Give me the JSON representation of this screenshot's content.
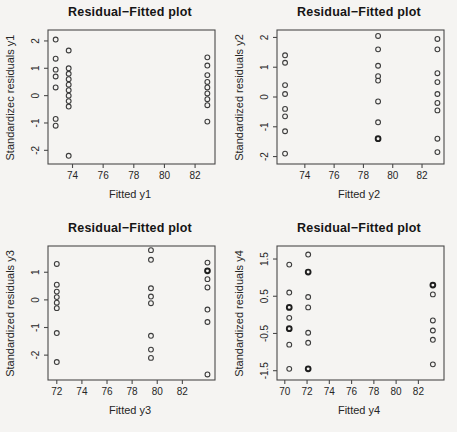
{
  "page": {
    "background": "#f5f4f2",
    "axis_color": "#4a4a4a",
    "text_color": "#262626",
    "point_color": "#3c3c3c",
    "bold_point_color": "#1e1e1e"
  },
  "chart_data": [
    {
      "type": "scatter",
      "title": "Residual−Fitted plot",
      "xlabel": "Fitted y1",
      "ylabel": "Standardizec residuals y1",
      "xlim": [
        72.4,
        83.3
      ],
      "ylim": [
        -2.5,
        2.4
      ],
      "xticks": [
        74,
        76,
        78,
        80,
        82
      ],
      "yticks": [
        -2,
        -1,
        0,
        1,
        2
      ],
      "grid": false,
      "legend": false,
      "points": [
        [
          72.9,
          2.05
        ],
        [
          72.9,
          1.35
        ],
        [
          72.9,
          0.95
        ],
        [
          72.9,
          0.7
        ],
        [
          72.9,
          0.3
        ],
        [
          72.9,
          -0.85
        ],
        [
          72.9,
          -1.1
        ],
        [
          73.75,
          1.65
        ],
        [
          73.75,
          1.0
        ],
        [
          73.75,
          0.8
        ],
        [
          73.75,
          0.6
        ],
        [
          73.75,
          0.4
        ],
        [
          73.75,
          0.2
        ],
        [
          73.75,
          0.0
        ],
        [
          73.75,
          -0.2
        ],
        [
          73.75,
          -0.4
        ],
        [
          73.75,
          -2.2
        ],
        [
          82.8,
          1.4
        ],
        [
          82.8,
          1.1
        ],
        [
          82.8,
          0.75
        ],
        [
          82.8,
          0.5
        ],
        [
          82.8,
          0.3
        ],
        [
          82.8,
          0.08
        ],
        [
          82.8,
          -0.13
        ],
        [
          82.8,
          -0.35
        ],
        [
          82.8,
          -0.95
        ]
      ]
    },
    {
      "type": "scatter",
      "title": "Residual−Fitted plot",
      "xlabel": "Fitted y2",
      "ylabel": "Standardized residuals y2",
      "xlim": [
        72.1,
        83.5
      ],
      "ylim": [
        -2.25,
        2.25
      ],
      "xticks": [
        74,
        76,
        78,
        80,
        82
      ],
      "yticks": [
        -2,
        -1,
        0,
        1,
        2
      ],
      "grid": false,
      "legend": false,
      "points": [
        [
          72.65,
          1.4
        ],
        [
          72.65,
          1.15
        ],
        [
          72.65,
          0.4
        ],
        [
          72.65,
          0.1
        ],
        [
          72.65,
          -0.4
        ],
        [
          72.65,
          -0.65
        ],
        [
          72.65,
          -1.15
        ],
        [
          72.65,
          -1.9
        ],
        [
          79.0,
          2.05
        ],
        [
          79.0,
          1.6
        ],
        [
          79.0,
          1.05
        ],
        [
          79.0,
          0.7
        ],
        [
          79.0,
          0.55
        ],
        [
          79.0,
          -0.15
        ],
        [
          79.0,
          -0.85
        ],
        [
          79.0,
          -1.4,
          1
        ],
        [
          83.05,
          1.95
        ],
        [
          83.05,
          1.6
        ],
        [
          83.05,
          0.8
        ],
        [
          83.05,
          0.5
        ],
        [
          83.05,
          0.1
        ],
        [
          83.05,
          -0.2
        ],
        [
          83.05,
          -0.45
        ],
        [
          83.05,
          -1.4
        ],
        [
          83.05,
          -1.85
        ]
      ]
    },
    {
      "type": "scatter",
      "title": "Residual−Fitted plot",
      "xlabel": "Fitted y3",
      "ylabel": "Standardized residuals y3",
      "xlim": [
        71.3,
        84.6
      ],
      "ylim": [
        -2.9,
        1.95
      ],
      "xticks": [
        72,
        74,
        76,
        78,
        80,
        82
      ],
      "yticks": [
        -2,
        -1,
        0,
        1
      ],
      "grid": false,
      "legend": false,
      "points": [
        [
          72.0,
          1.3
        ],
        [
          72.0,
          0.55
        ],
        [
          72.0,
          0.3
        ],
        [
          72.0,
          0.1
        ],
        [
          72.0,
          -0.1
        ],
        [
          72.0,
          -0.3
        ],
        [
          72.0,
          -1.2
        ],
        [
          72.0,
          -2.25
        ],
        [
          79.5,
          1.8
        ],
        [
          79.5,
          1.45
        ],
        [
          79.5,
          0.42
        ],
        [
          79.5,
          0.12
        ],
        [
          79.5,
          -0.12
        ],
        [
          79.5,
          -1.3
        ],
        [
          79.5,
          -1.8
        ],
        [
          79.5,
          -2.1
        ],
        [
          84.0,
          1.35
        ],
        [
          84.0,
          1.05,
          1
        ],
        [
          84.0,
          0.75
        ],
        [
          84.0,
          0.45
        ],
        [
          84.0,
          -0.35
        ],
        [
          84.0,
          -0.8
        ],
        [
          84.0,
          -2.7
        ]
      ]
    },
    {
      "type": "scatter",
      "title": "Residual−Fitted plot",
      "xlabel": "Fitted y4",
      "ylabel": "Standardized residuals y4",
      "xlim": [
        69.3,
        84.3
      ],
      "ylim": [
        -1.75,
        1.85
      ],
      "xticks": [
        70,
        72,
        74,
        76,
        78,
        80,
        82
      ],
      "yticks": [
        -1.5,
        -0.5,
        0.5,
        1.5
      ],
      "grid": false,
      "legend": false,
      "points": [
        [
          70.4,
          1.35
        ],
        [
          70.4,
          0.6
        ],
        [
          70.4,
          0.2,
          1
        ],
        [
          70.4,
          -0.08
        ],
        [
          70.4,
          -0.37,
          1
        ],
        [
          70.4,
          -0.8
        ],
        [
          70.4,
          -1.45
        ],
        [
          72.1,
          1.62
        ],
        [
          72.1,
          1.15,
          1
        ],
        [
          72.1,
          0.48
        ],
        [
          72.1,
          0.2
        ],
        [
          72.1,
          -0.48
        ],
        [
          72.1,
          -0.75
        ],
        [
          72.1,
          -1.45,
          1
        ],
        [
          83.3,
          0.8,
          1
        ],
        [
          83.3,
          0.55
        ],
        [
          83.3,
          -0.15
        ],
        [
          83.3,
          -0.42
        ],
        [
          83.3,
          -0.67
        ],
        [
          83.3,
          -1.33
        ]
      ]
    }
  ]
}
